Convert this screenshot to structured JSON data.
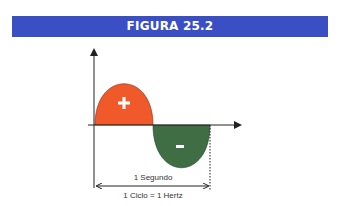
{
  "header": {
    "title": "FIGURA 25.2"
  },
  "diagram": {
    "positive_sign": "+",
    "negative_sign": "-",
    "period_label": "1 Segundo",
    "cycle_label": "1 Ciclo = 1 Hertz",
    "colors": {
      "header": "#3a4fc4",
      "positive": "#f05a2a",
      "negative": "#3f6e45",
      "axis": "#222222"
    }
  }
}
